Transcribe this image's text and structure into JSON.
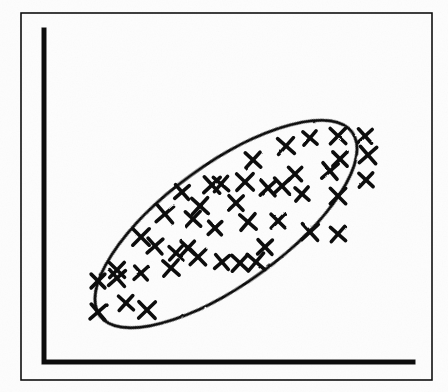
{
  "figure": {
    "caption": "",
    "media": "scanned-book-page",
    "colors": {
      "ink": "#101010",
      "paper": "#fdfdfd",
      "bleed_through": "#cfcfcf"
    },
    "frame": {
      "name": "figure-border",
      "x": 21,
      "y": 13,
      "width": 411,
      "height": 367,
      "stroke_width": 1.6
    },
    "axes": {
      "y_axis": {
        "x": 44,
        "y_top": 30,
        "y_bottom": 362,
        "stroke_width": 5
      },
      "x_axis": {
        "y": 362,
        "x_left": 43,
        "x_right": 413,
        "stroke_width": 5
      },
      "x_tick_labels": [],
      "y_tick_labels": [],
      "xlabel": "",
      "ylabel": ""
    },
    "bleed_through_text": {
      "line_1": "onie n      tingen:  x  0 s",
      "line_2": "quency",
      "line_3": "63",
      "line_4": "68",
      "line_5": "re required"
    }
  },
  "chart_data": {
    "type": "scatter",
    "title": "",
    "subtitle": "",
    "xlabel": "",
    "ylabel": "",
    "xlim": [
      0,
      100
    ],
    "ylim": [
      0,
      100
    ],
    "grid": false,
    "legend": null,
    "marker": {
      "symbol": "x",
      "name": "x-cross-marker",
      "size_px": 15,
      "stroke_width_px": 3.6,
      "color": "#101010"
    },
    "relationship": "positive linear correlation",
    "annotations": [
      {
        "name": "enclosing-ellipse",
        "type": "ellipse",
        "center_px": [
          226,
          224
        ],
        "semi_major_px": 156,
        "semi_minor_px": 60,
        "rotation_deg": -36,
        "stroke_width_px": 3,
        "fill": "none",
        "style": "hand-drawn"
      }
    ],
    "n_points": 44,
    "points_px": [
      [
        310,
        138
      ],
      [
        338,
        136
      ],
      [
        365,
        136
      ],
      [
        286,
        146
      ],
      [
        340,
        159
      ],
      [
        368,
        155
      ],
      [
        253,
        160
      ],
      [
        295,
        174
      ],
      [
        330,
        171
      ],
      [
        366,
        180
      ],
      [
        212,
        185
      ],
      [
        221,
        184
      ],
      [
        245,
        182
      ],
      [
        268,
        188
      ],
      [
        302,
        194
      ],
      [
        338,
        196
      ],
      [
        182,
        192
      ],
      [
        200,
        206
      ],
      [
        236,
        203
      ],
      [
        165,
        214
      ],
      [
        193,
        219
      ],
      [
        215,
        228
      ],
      [
        248,
        222
      ],
      [
        278,
        221
      ],
      [
        310,
        232
      ],
      [
        338,
        234
      ],
      [
        141,
        237
      ],
      [
        155,
        246
      ],
      [
        176,
        253
      ],
      [
        198,
        257
      ],
      [
        222,
        262
      ],
      [
        240,
        263
      ],
      [
        265,
        247
      ],
      [
        256,
        262
      ],
      [
        117,
        270
      ],
      [
        141,
        273
      ],
      [
        171,
        268
      ],
      [
        98,
        281
      ],
      [
        117,
        278
      ],
      [
        126,
        303
      ],
      [
        147,
        310
      ],
      [
        98,
        312
      ],
      [
        188,
        248
      ],
      [
        282,
        186
      ]
    ]
  }
}
